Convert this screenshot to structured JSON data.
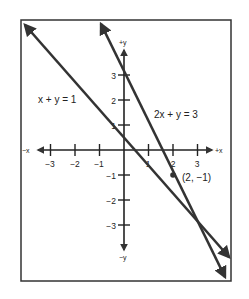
{
  "figure": {
    "equations": {
      "line1": "x + y = 1",
      "line2": "2x + y = 3"
    },
    "intersection_label": "(2, −1)",
    "axes": {
      "x_pos_label": "+x",
      "x_neg_label": "−x",
      "y_pos_label": "+y",
      "y_neg_label": "−y"
    },
    "x_ticks": [
      {
        "label": "−3"
      },
      {
        "label": "−2"
      },
      {
        "label": "−1"
      },
      {
        "label": "1"
      },
      {
        "label": "2"
      },
      {
        "label": "3"
      }
    ],
    "y_ticks": [
      {
        "label": "3"
      },
      {
        "label": "2"
      },
      {
        "label": "1"
      },
      {
        "label": "−1"
      },
      {
        "label": "−2"
      },
      {
        "label": "−3"
      }
    ],
    "colors": {
      "line": "#333333",
      "frame": "#333333",
      "background": "#ffffff"
    }
  }
}
